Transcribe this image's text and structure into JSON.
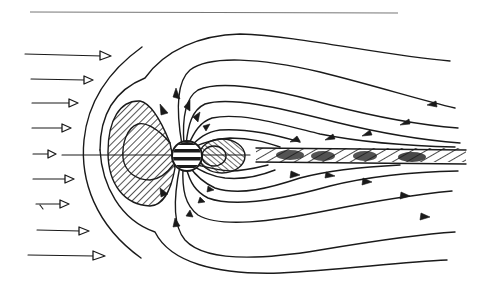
{
  "diagram": {
    "title": "",
    "labels": [],
    "colors": {
      "ink": "#1a1a1a",
      "background": "#ffffff",
      "rule": "#777777"
    },
    "elements": {
      "top_rule": {
        "present": true
      },
      "solar_wind_arrows": {
        "count": 9,
        "direction": "right",
        "style": "open-triangle-head"
      },
      "bow_shock": {
        "present": true
      },
      "magnetopause": {
        "present": true
      },
      "earth": {
        "shape": "circle",
        "fill": "horizontal-stripes"
      },
      "dayside_radiation_belt": {
        "fill": "diagonal-hatch"
      },
      "nightside_radiation_belt": {
        "fill": "diagonal-hatch"
      },
      "plasma_sheet": {
        "fill": "hatch-and-dots",
        "direction": "tailward"
      },
      "field_lines_north": {
        "count": 8,
        "arrow_direction": "toward-earth"
      },
      "field_lines_south": {
        "count": 8,
        "arrow_direction": "away-from-earth"
      }
    }
  }
}
